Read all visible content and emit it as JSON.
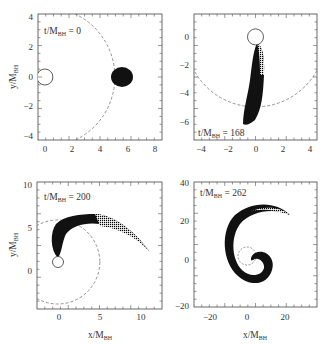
{
  "chart_data": [
    {
      "type": "scatter",
      "title": "",
      "annotation": "t/M_BH = 0",
      "time": 0,
      "xlabel": "",
      "ylabel": "y/M_BH",
      "xlim": [
        -0.5,
        8.5
      ],
      "ylim": [
        -4.3,
        4.3
      ],
      "xticks": [
        0,
        2,
        4,
        6,
        8
      ],
      "yticks": [
        -4,
        -2,
        0,
        2,
        4
      ],
      "black_hole": {
        "x": 0,
        "y": 0,
        "r": 0.6
      },
      "circle_dashed_radius": 5.0,
      "star": {
        "shape": "ellipse",
        "cx": 5.6,
        "cy": 0,
        "rx": 0.8,
        "ry": 0.7
      }
    },
    {
      "type": "scatter",
      "annotation": "t/M_BH = 168",
      "time": 168,
      "xlabel": "",
      "ylabel": "",
      "xlim": [
        -4.5,
        4.5
      ],
      "ylim": [
        -7.2,
        1.6
      ],
      "xticks": [
        -4,
        -2,
        0,
        2,
        4
      ],
      "yticks": [
        -6,
        -4,
        -2,
        0
      ],
      "black_hole": {
        "x": 0,
        "y": 0,
        "r": 0.6
      },
      "circle_dashed_radius": 5.0,
      "star": {
        "shape": "stretched stream",
        "from": [
          0.1,
          -0.5
        ],
        "to": [
          -0.6,
          -5.8
        ]
      }
    },
    {
      "type": "scatter",
      "annotation": "t/M_BH = 200",
      "time": 200,
      "xlabel": "x/M_BH",
      "ylabel": "y/M_BH",
      "xlim": [
        -2.5,
        12.5
      ],
      "ylim": [
        -4.5,
        10.5
      ],
      "xticks": [
        0,
        5,
        10
      ],
      "yticks": [
        0,
        5,
        10
      ],
      "black_hole": {
        "x": 0,
        "y": 0,
        "r": 0.6
      },
      "circle_dashed_radius": 5.0,
      "star": {
        "shape": "arc stream",
        "from": [
          0,
          1
        ],
        "to": [
          11,
          1.5
        ]
      }
    },
    {
      "type": "scatter",
      "annotation": "t/M_BH = 262",
      "time": 262,
      "xlabel": "x/M_BH",
      "ylabel": "",
      "xlim": [
        -28,
        37
      ],
      "ylim": [
        -22,
        43
      ],
      "xticks": [
        -20,
        0,
        20
      ],
      "yticks": [
        -20,
        0,
        20,
        40
      ],
      "black_hole": {
        "x": 0,
        "y": 0,
        "r": 0.6
      },
      "circle_dashed_radius": 5.0,
      "star": {
        "shape": "spiral stream",
        "outer_end": [
          22,
          20
        ]
      }
    }
  ],
  "labels": {
    "p1_time": "t/M",
    "p1_sub": "BH",
    "p1_val": " = 0",
    "p2_val": " = 168",
    "p3_val": " = 200",
    "p4_val": " = 262",
    "y_main": "y/M",
    "x_main": "x/M",
    "sub": "BH"
  }
}
